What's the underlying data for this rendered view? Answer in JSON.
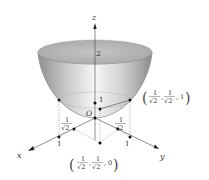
{
  "diagram": {
    "type": "3d-paraboloid",
    "axes": {
      "x_label": "x",
      "y_label": "y",
      "z_label": "z",
      "origin_label": "O"
    },
    "labels": {
      "top_height": "2",
      "z_one": "1",
      "x_one": "1",
      "y_one": "1",
      "x_half": {
        "num": "1",
        "den": "√2"
      },
      "y_half": {
        "num": "1",
        "den": "√2"
      }
    },
    "points": {
      "upper": {
        "open": "(",
        "x_num": "1",
        "x_den": "√2",
        "sep1": ",",
        "y_num": "1",
        "y_den": "√2",
        "sep2": ",",
        "z": "1",
        "close": ")"
      },
      "base": {
        "open": "(",
        "x_num": "1",
        "x_den": "√2",
        "sep1": ",",
        "y_num": "1",
        "y_den": "√2",
        "sep2": ",",
        "z": "0",
        "close": ")"
      }
    },
    "colors": {
      "surface_light": "#f4f4f4",
      "surface_dark": "#9a9a9a",
      "cap": "#b8b8b8",
      "line": "#444444",
      "dot": "#111111",
      "dotted": "#777777"
    }
  }
}
